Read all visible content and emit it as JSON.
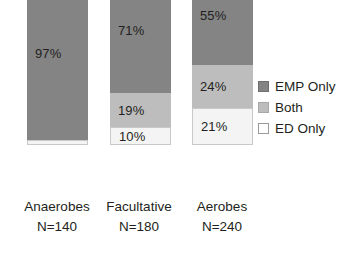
{
  "chart_data": {
    "type": "bar",
    "subtype": "stacked-100-percent",
    "title": "",
    "subtitle": "",
    "xlabel": "",
    "ylabel": "",
    "ylim": [
      0,
      100
    ],
    "grid": false,
    "axes_visible": false,
    "orientation": "vertical",
    "value_unit": "%",
    "legend": {
      "position": "right",
      "entries": [
        {
          "name": "EMP Only",
          "color": "#848484"
        },
        {
          "name": "Both",
          "color": "#bdbdbd"
        },
        {
          "name": "ED Only",
          "color": "#ffffff"
        }
      ]
    },
    "categories": [
      "Anaerobes",
      "Facultative",
      "Aerobes"
    ],
    "category_counts": [
      "N=140",
      "N=180",
      "N=240"
    ],
    "series": [
      {
        "name": "EMP Only",
        "color": "#848484",
        "values": [
          97,
          71,
          55
        ]
      },
      {
        "name": "Both",
        "color": "#bdbdbd",
        "values": [
          0,
          19,
          24
        ]
      },
      {
        "name": "ED Only",
        "color": "#f4f4f4",
        "values": [
          3,
          10,
          21
        ]
      }
    ],
    "bars": [
      {
        "category": "Anaerobes",
        "count_label": "N=140",
        "segments": [
          {
            "series": "EMP Only",
            "value": 97,
            "label": "97%",
            "label_visible": true
          },
          {
            "series": "Both",
            "value": 0,
            "label": "",
            "label_visible": false
          },
          {
            "series": "ED Only",
            "value": 3,
            "label": "",
            "label_visible": false
          }
        ]
      },
      {
        "category": "Facultative",
        "count_label": "N=180",
        "segments": [
          {
            "series": "EMP Only",
            "value": 71,
            "label": "71%",
            "label_visible": true
          },
          {
            "series": "Both",
            "value": 19,
            "label": "19%",
            "label_visible": true
          },
          {
            "series": "ED Only",
            "value": 10,
            "label": "10%",
            "label_visible": true
          }
        ]
      },
      {
        "category": "Aerobes",
        "count_label": "N=240",
        "segments": [
          {
            "series": "EMP Only",
            "value": 55,
            "label": "55%",
            "label_visible": true
          },
          {
            "series": "Both",
            "value": 24,
            "label": "24%",
            "label_visible": true
          },
          {
            "series": "ED Only",
            "value": 21,
            "label": "21%",
            "label_visible": true
          }
        ]
      }
    ]
  },
  "colors": {
    "emp_only": "#848484",
    "both": "#bdbdbd",
    "ed_only": "#f4f4f4",
    "text": "#231f20",
    "background": "#ffffff"
  }
}
